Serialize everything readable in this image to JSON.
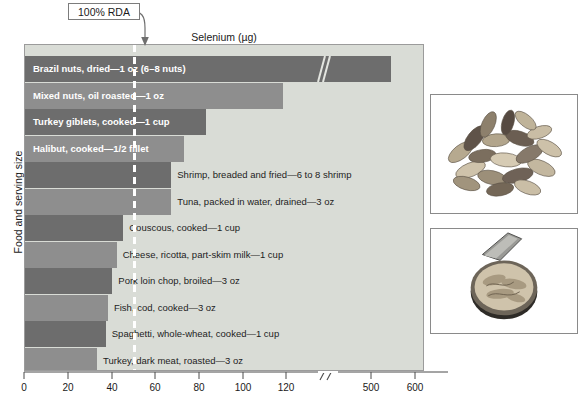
{
  "chart_data": {
    "type": "bar",
    "orientation": "horizontal",
    "title": "",
    "xlabel": "Selenium (µg)",
    "ylabel": "Food and serving size",
    "xlim": [
      0,
      650
    ],
    "axis_break": {
      "from": 130,
      "to": 480,
      "label": "//"
    },
    "grid": false,
    "legend": null,
    "tick_labels": [
      "0",
      "20",
      "40",
      "60",
      "80",
      "100",
      "120",
      "500",
      "600"
    ],
    "tick_values": [
      0,
      20,
      40,
      60,
      80,
      100,
      120,
      500,
      600
    ],
    "reference_line": {
      "label": "100% RDA",
      "value": 50
    },
    "categories": [
      "Brazil nuts, dried—1 oz (6–8 nuts)",
      "Mixed nuts, oil roasted—1 oz",
      "Turkey giblets, cooked—1 cup",
      "Halibut, cooked—1/2 fillet",
      "Shrimp, breaded and fried—6 to 8 shrimp",
      "Tuna, packed in water, drained—3 oz",
      "Couscous, cooked—1 cup",
      "Cheese, ricotta, part-skim milk—1 cup",
      "Pork loin chop, broiled—3 oz",
      "Fish, cod, cooked—3 oz",
      "Spaghetti, whole-wheat, cooked—1 cup",
      "Turkey, dark meat, roasted—3 oz"
    ],
    "values": [
      544,
      118,
      83,
      73,
      67,
      67,
      45,
      42,
      40,
      38,
      37,
      33
    ]
  },
  "callout": {
    "label": "100% RDA"
  },
  "axis": {
    "x_title": "Selenium (µg)",
    "y_title": "Food and serving size",
    "break_glyph": "//"
  },
  "bars": [
    {
      "label": "Brazil nuts, dried—1 oz (6–8 nuts)",
      "value": 544,
      "shade": "dark",
      "label_position": "inside"
    },
    {
      "label": "Mixed nuts, oil roasted—1 oz",
      "value": 118,
      "shade": "light",
      "label_position": "inside"
    },
    {
      "label": "Turkey giblets, cooked—1 cup",
      "value": 83,
      "shade": "dark",
      "label_position": "inside"
    },
    {
      "label": "Halibut, cooked—1/2 fillet",
      "value": 73,
      "shade": "light",
      "label_position": "inside"
    },
    {
      "label": "Shrimp, breaded and fried—6 to 8 shrimp",
      "value": 67,
      "shade": "dark",
      "label_position": "outside"
    },
    {
      "label": "Tuna, packed in water, drained—3 oz",
      "value": 67,
      "shade": "light",
      "label_position": "outside"
    },
    {
      "label": "Couscous, cooked—1 cup",
      "value": 45,
      "shade": "dark",
      "label_position": "outside"
    },
    {
      "label": "Cheese, ricotta, part-skim milk—1 cup",
      "value": 42,
      "shade": "light",
      "label_position": "outside"
    },
    {
      "label": "Pork loin chop, broiled—3 oz",
      "value": 40,
      "shade": "dark",
      "label_position": "outside"
    },
    {
      "label": "Fish, cod, cooked—3 oz",
      "value": 38,
      "shade": "light",
      "label_position": "outside"
    },
    {
      "label": "Spaghetti, whole-wheat, cooked—1 cup",
      "value": 37,
      "shade": "dark",
      "label_position": "outside"
    },
    {
      "label": "Turkey, dark meat, roasted—3 oz",
      "value": 33,
      "shade": "light",
      "label_position": "outside"
    }
  ],
  "photos": [
    {
      "name": "brazil-nuts-photo",
      "caption": ""
    },
    {
      "name": "tuna-can-photo",
      "caption": ""
    }
  ],
  "colors": {
    "plot_background": "#d9dcd6",
    "bar_dark": "#6d6d6d",
    "bar_light": "#8e8e8e",
    "reference_line": "#ffffff",
    "frame": "#9b9b9b"
  }
}
